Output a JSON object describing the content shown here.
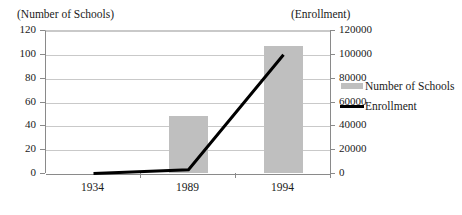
{
  "chart_data": {
    "type": "bar",
    "title": "",
    "subtitle": "",
    "categories": [
      "1934",
      "1989",
      "1994"
    ],
    "xlabel": "",
    "grid": true,
    "legend_position": "right",
    "axes": {
      "left": {
        "label": "(Number of Schools)",
        "ticks": [
          "0",
          "20",
          "40",
          "60",
          "80",
          "100",
          "120"
        ],
        "tick_values": [
          0,
          20,
          40,
          60,
          80,
          100,
          120
        ],
        "ylim": [
          0,
          120
        ]
      },
      "right": {
        "label": "(Enrollment)",
        "ticks": [
          "0",
          "20000",
          "40000",
          "60000",
          "80000",
          "100000",
          "120000"
        ],
        "tick_values": [
          0,
          20000,
          40000,
          60000,
          80000,
          100000,
          120000
        ],
        "ylim": [
          0,
          120000
        ]
      }
    },
    "series": [
      {
        "name": "Number of Schools",
        "type": "bar",
        "axis": "left",
        "color": "#bfbfbf",
        "values": [
          0,
          48,
          107
        ]
      },
      {
        "name": "Enrollment",
        "type": "line",
        "axis": "right",
        "color": "#000000",
        "values": [
          500,
          3500,
          100000
        ]
      }
    ]
  },
  "legend": {
    "items": [
      {
        "label": "Number of Schools",
        "marker": "bar-swatch-icon",
        "color": "#bfbfbf"
      },
      {
        "label": "Enrollment",
        "marker": "line-swatch-icon",
        "color": "#000000"
      }
    ]
  }
}
